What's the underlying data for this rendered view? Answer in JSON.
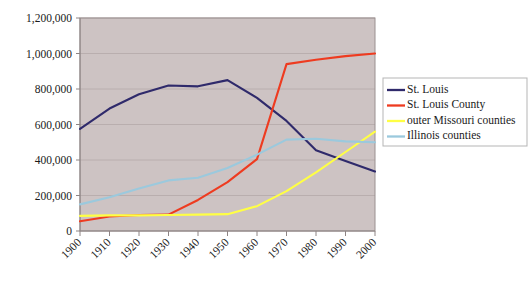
{
  "chart_data": {
    "type": "line",
    "title": "",
    "subtitle": "",
    "xlabel": "",
    "ylabel": "",
    "x": [
      1900,
      1910,
      1920,
      1930,
      1940,
      1950,
      1960,
      1970,
      1980,
      1990,
      2000
    ],
    "xtick_labels": [
      "1900",
      "1910",
      "1920",
      "1930",
      "1940",
      "1950",
      "1960",
      "1970",
      "1980",
      "1990",
      "2000"
    ],
    "ytick_labels": [
      "0",
      "200,000",
      "400,000",
      "600,000",
      "800,000",
      "1,000,000",
      "1,200,000"
    ],
    "ytick_values": [
      0,
      200000,
      400000,
      600000,
      800000,
      1000000,
      1200000
    ],
    "ylim": [
      0,
      1200000
    ],
    "xlim": [
      1900,
      2000
    ],
    "grid": true,
    "legend_position": "right",
    "series": [
      {
        "name": "St. Louis",
        "color": "#2f2a6b",
        "values": [
          575000,
          690000,
          770000,
          820000,
          815000,
          850000,
          750000,
          620000,
          455000,
          395000,
          335000
        ]
      },
      {
        "name": "St. Louis County",
        "color": "#ee3b20",
        "values": [
          55000,
          82000,
          90000,
          92000,
          175000,
          275000,
          405000,
          940000,
          965000,
          985000,
          1000000
        ]
      },
      {
        "name": "outer Missouri counties",
        "color": "#ffff44",
        "values": [
          85000,
          88000,
          88000,
          90000,
          92000,
          95000,
          140000,
          225000,
          330000,
          445000,
          560000
        ]
      },
      {
        "name": "Illinois counties",
        "color": "#9bc9dd",
        "values": [
          150000,
          190000,
          240000,
          285000,
          300000,
          355000,
          430000,
          515000,
          520000,
          505000,
          500000
        ]
      }
    ]
  },
  "legend": {
    "items": [
      {
        "label": "St. Louis",
        "color": "#2f2a6b"
      },
      {
        "label": "St. Louis County",
        "color": "#ee3b20"
      },
      {
        "label": "outer Missouri counties",
        "color": "#ffff44"
      },
      {
        "label": "Illinois counties",
        "color": "#9bc9dd"
      }
    ]
  },
  "colors": {
    "plot_background": "#cdc3c3",
    "page_background": "#ffffff",
    "gridline": "#b9aeae",
    "axis": "#8d8484",
    "text": "#1a1a1a"
  }
}
